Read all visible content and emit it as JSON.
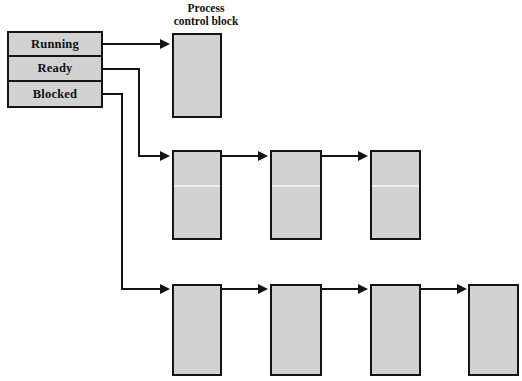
{
  "diagram": {
    "title_lines": [
      "Process",
      "control block"
    ],
    "state_table": {
      "rows": [
        {
          "label": "Running"
        },
        {
          "label": "Ready"
        },
        {
          "label": "Blocked"
        }
      ]
    },
    "queues": [
      {
        "name": "running-queue",
        "source_state": "Running",
        "block_count": 1,
        "blocks": [
          {
            "label": ""
          }
        ]
      },
      {
        "name": "ready-queue",
        "source_state": "Ready",
        "block_count": 3,
        "blocks": [
          {
            "label": ""
          },
          {
            "label": ""
          },
          {
            "label": ""
          }
        ]
      },
      {
        "name": "blocked-queue",
        "source_state": "Blocked",
        "block_count": 4,
        "blocks": [
          {
            "label": ""
          },
          {
            "label": ""
          },
          {
            "label": ""
          },
          {
            "label": ""
          }
        ]
      }
    ],
    "colors": {
      "block_fill": "#d2d2d2",
      "stroke": "#141414",
      "background": "#ffffff",
      "seam": "#f2f2f2"
    }
  }
}
